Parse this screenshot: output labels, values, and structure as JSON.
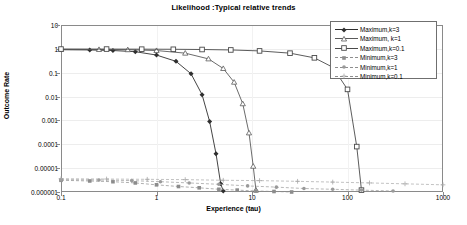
{
  "chart_data": {
    "type": "line",
    "title": "Likelihood :Typical relative trends",
    "xlabel": "Experience (tau)",
    "ylabel": "Outcome Rate",
    "xscale": "log",
    "yscale": "log",
    "xlim": [
      0.1,
      1000
    ],
    "ylim": [
      1e-06,
      10
    ],
    "xticks": [
      "0.1",
      "1",
      "10",
      "100",
      "1000"
    ],
    "yticks": [
      "10",
      "1",
      "0.1",
      "0.01",
      "0.001",
      "0.0001",
      "0.00001",
      "0.000001"
    ],
    "grid": true,
    "legend_position": "top-right",
    "series": [
      {
        "name": "Maximum,k=3",
        "marker": "diamond",
        "line": "solid",
        "color": "#2f2f2f",
        "x": [
          0.1,
          0.2,
          0.35,
          0.6,
          1.0,
          1.6,
          2.3,
          3.0,
          3.6,
          4.2,
          4.7,
          5.0
        ],
        "y": [
          0.92,
          0.9,
          0.85,
          0.76,
          0.55,
          0.3,
          0.09,
          0.012,
          0.0009,
          4e-05,
          2.2e-06,
          1.1e-06
        ]
      },
      {
        "name": "Maximum, k=1",
        "marker": "triangle",
        "line": "solid",
        "color": "#5a5a5a",
        "x": [
          0.1,
          0.25,
          0.5,
          1.0,
          2.0,
          3.5,
          5.0,
          6.5,
          8.0,
          9.3,
          10.3,
          11.0
        ],
        "y": [
          0.95,
          0.94,
          0.92,
          0.85,
          0.66,
          0.38,
          0.15,
          0.04,
          0.005,
          0.0003,
          1.2e-05,
          1.2e-06
        ]
      },
      {
        "name": "Maximum,k=0.1",
        "marker": "square",
        "line": "solid",
        "color": "#4a4a4a",
        "x": [
          0.1,
          0.3,
          0.7,
          1.5,
          3.0,
          6.0,
          12.0,
          25.0,
          45.0,
          70.0,
          100.0,
          125.0,
          140.0
        ],
        "y": [
          0.98,
          0.98,
          0.97,
          0.96,
          0.94,
          0.9,
          0.82,
          0.66,
          0.42,
          0.17,
          0.02,
          8e-05,
          1.2e-06
        ]
      },
      {
        "name": "Minimum,k=3",
        "marker": "small-square",
        "line": "dashed",
        "color": "#8c8c8c",
        "x": [
          0.1,
          0.2,
          0.35,
          0.6,
          1.0,
          1.7,
          2.8,
          4.5,
          7.0,
          11.0,
          17.0,
          26.0
        ],
        "y": [
          3.1e-06,
          2.9e-06,
          2.7e-06,
          2.4e-06,
          2e-06,
          1.7e-06,
          1.5e-06,
          1.3e-06,
          1.2e-06,
          1.1e-06,
          1.05e-06,
          1e-06
        ]
      },
      {
        "name": "Minimum,k=1",
        "marker": "circle",
        "line": "dashed",
        "color": "#9a9a9a",
        "x": [
          0.1,
          0.25,
          0.55,
          1.1,
          2.2,
          4.5,
          9.0,
          18.0,
          35.0,
          70.0,
          140.0,
          300.0
        ],
        "y": [
          3.3e-06,
          3.2e-06,
          3e-06,
          2.7e-06,
          2.4e-06,
          2.1e-06,
          1.8e-06,
          1.6e-06,
          1.4e-06,
          1.3e-06,
          1.2e-06,
          1.1e-06
        ]
      },
      {
        "name": "Minimum,k=0.1",
        "marker": "plus",
        "line": "dashed",
        "color": "#a8a8a8",
        "x": [
          0.1,
          0.3,
          0.8,
          2.0,
          5.0,
          12.0,
          30.0,
          70.0,
          170.0,
          400.0,
          1000.0
        ],
        "y": [
          3.6e-06,
          3.5e-06,
          3.4e-06,
          3.3e-06,
          3.1e-06,
          3e-06,
          2.8e-06,
          2.6e-06,
          2.4e-06,
          2.2e-06,
          2e-06
        ]
      }
    ]
  },
  "legend": {
    "items": [
      {
        "label": "Maximum,k=3"
      },
      {
        "label": "Maximum, k=1"
      },
      {
        "label": "Maximum,k=0.1"
      },
      {
        "label": "Minimum,k=3"
      },
      {
        "label": "Minimum,k=1"
      },
      {
        "label": "Minimum,k=0.1"
      }
    ]
  }
}
